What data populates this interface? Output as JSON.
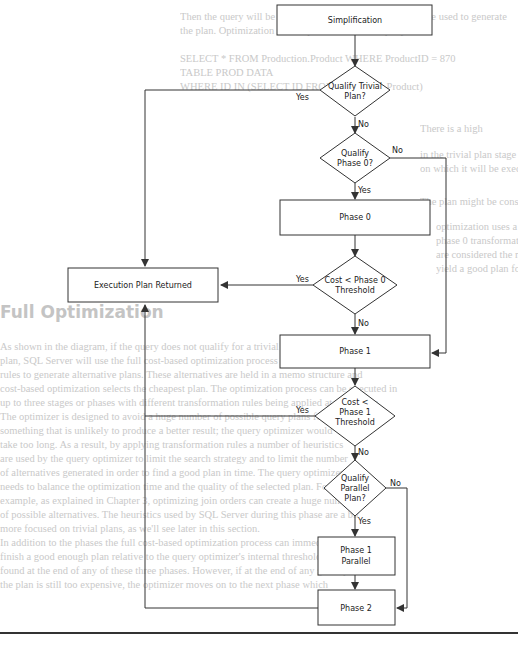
{
  "background_text": {
    "lines": [
      {
        "x": 180,
        "y": 10,
        "text": "Then the query will be executed using the statistics that were used to generate"
      },
      {
        "x": 180,
        "y": 24,
        "text": "the plan. Optimization is then performed on the query."
      },
      {
        "x": 180,
        "y": 52,
        "text": "SELECT * FROM Production.Product WHERE ProductID = 870"
      },
      {
        "x": 180,
        "y": 66,
        "text": "TABLE PROD DATA"
      },
      {
        "x": 180,
        "y": 80,
        "text": "WHERE ID IN (SELECT ID FROM Production.Product)"
      },
      {
        "x": 420,
        "y": 122,
        "text": "There is a high"
      },
      {
        "x": 420,
        "y": 148,
        "text": "in the trivial plan stage using the estimated ProductID"
      },
      {
        "x": 420,
        "y": 162,
        "text": "on which it will be executed as available in the table"
      },
      {
        "x": 420,
        "y": 195,
        "text": "The plan might be considered for this stage of product"
      },
      {
        "x": 436,
        "y": 220,
        "text": "optimization uses a set of simple"
      },
      {
        "x": 436,
        "y": 234,
        "text": "phase 0 transformation rules that"
      },
      {
        "x": 436,
        "y": 248,
        "text": "are considered the most likely to"
      },
      {
        "x": 436,
        "y": 262,
        "text": "yield a good plan for the query"
      },
      {
        "x": 0,
        "y": 340,
        "text": "As shown in the diagram, if the query does not qualify for a trivial"
      },
      {
        "x": 0,
        "y": 354,
        "text": "plan, SQL Server will use the full cost-based optimization process which uses transformation"
      },
      {
        "x": 0,
        "y": 368,
        "text": "rules to generate alternative plans. These alternatives are held in a memo structure and"
      },
      {
        "x": 0,
        "y": 382,
        "text": "cost-based optimization selects the cheapest plan. The optimization process can be executed in"
      },
      {
        "x": 0,
        "y": 396,
        "text": "up to three stages or phases with different transformation rules being applied at each stage."
      },
      {
        "x": 0,
        "y": 410,
        "text": "The optimizer is designed to avoid a huge number of possible query plans for"
      },
      {
        "x": 0,
        "y": 424,
        "text": "something that is unlikely to produce a better result; the query optimizer would"
      },
      {
        "x": 0,
        "y": 438,
        "text": "take too long. As a result, by applying transformation rules a number of heuristics"
      },
      {
        "x": 0,
        "y": 452,
        "text": "are used by the query optimizer to limit the search strategy and to limit the number"
      },
      {
        "x": 0,
        "y": 466,
        "text": "of alternatives generated in order to find a good plan in time. The query optimizer"
      },
      {
        "x": 0,
        "y": 480,
        "text": "needs to balance the optimization time and the quality of the selected plan. For"
      },
      {
        "x": 0,
        "y": 494,
        "text": "example, as explained in Chapter 3, optimizing join orders can create a huge number"
      },
      {
        "x": 0,
        "y": 508,
        "text": "of possible alternatives. The heuristics used by SQL Server during this phase are a bit"
      },
      {
        "x": 0,
        "y": 522,
        "text": "more focused on trivial plans, as we'll see later in this section."
      },
      {
        "x": 0,
        "y": 536,
        "text": "In addition to the phases the full cost-based optimization process can immediately"
      },
      {
        "x": 0,
        "y": 550,
        "text": "finish a good enough plan relative to the query optimizer's internal thresholds as"
      },
      {
        "x": 0,
        "y": 564,
        "text": "found at the end of any of these three phases. However, if at the end of any given phase"
      },
      {
        "x": 0,
        "y": 578,
        "text": "the plan is still too expensive, the optimizer moves on to the next phase which"
      }
    ],
    "heading": {
      "x": 0,
      "y": 305,
      "text": "Full Optimization"
    }
  },
  "flowchart": {
    "nodes": {
      "simplification": {
        "label": "Simplification"
      },
      "qualify_trivial": {
        "line1": "Qualify Trivial",
        "line2": "Plan?"
      },
      "qualify_phase0": {
        "line1": "Qualify",
        "line2": "Phase 0?"
      },
      "phase0": {
        "label": "Phase 0"
      },
      "cost_phase0": {
        "line1": "Cost < Phase 0",
        "line2": "Threshold"
      },
      "execution_plan": {
        "label": "Execution Plan Returned"
      },
      "phase1": {
        "label": "Phase 1"
      },
      "cost_phase1": {
        "line1": "Cost <",
        "line2": "Phase 1",
        "line3": "Threshold"
      },
      "qualify_parallel": {
        "line1": "Qualify",
        "line2": "Parallel",
        "line3": "Plan?"
      },
      "phase1_parallel": {
        "line1": "Phase 1",
        "line2": "Parallel"
      },
      "phase2": {
        "label": "Phase 2"
      }
    },
    "edge_labels": {
      "trivial_yes": "Yes",
      "trivial_no": "No",
      "phase0_no": "No",
      "phase0_yes": "Yes",
      "cost0_yes": "Yes",
      "cost0_no": "No",
      "cost1_yes": "Yes",
      "cost1_no": "No",
      "parallel_no": "No",
      "parallel_yes": "Yes"
    },
    "colors": {
      "stroke": "#333333",
      "text": "#222222",
      "fill": "#ffffff"
    }
  }
}
